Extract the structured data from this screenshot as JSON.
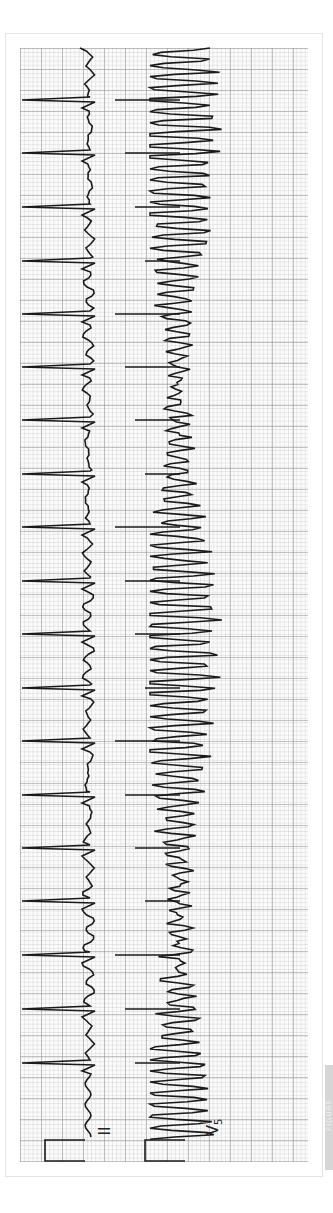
{
  "figure": {
    "leads": [
      {
        "label": "II",
        "name": "lead-ii",
        "baseline_x": 88,
        "r_peak_y": [
          100,
          153,
          207,
          261,
          314,
          367,
          420,
          474,
          527,
          581,
          634,
          688,
          741,
          795,
          848,
          901,
          955,
          1009,
          1063
        ]
      },
      {
        "label": "V5",
        "name": "lead-v5",
        "baseline_x": 150,
        "spike_y": [
          100,
          153,
          207,
          261,
          314,
          367,
          420,
          474,
          527,
          581,
          634,
          688,
          741,
          795,
          848,
          901,
          955,
          1009,
          1063
        ]
      }
    ],
    "calibration_label": "calibration-pulse",
    "tag_text": "FIGURE",
    "colors": {
      "trace": "#1a1a1a",
      "grid_major": "#969696",
      "grid_minor": "#bebebe",
      "tag": "#d6d6d6"
    }
  }
}
